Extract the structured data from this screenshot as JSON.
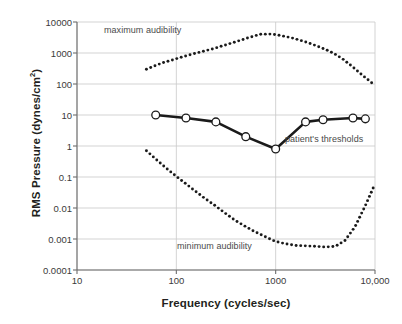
{
  "chart_data": {
    "type": "line",
    "title": "",
    "xlabel": "Frequency (cycles/sec)",
    "ylabel": "RMS Pressure (dynes/cm²)",
    "xscale": "log",
    "yscale": "log",
    "xlim": [
      10,
      10000
    ],
    "ylim": [
      0.0001,
      10000
    ],
    "grid": true,
    "legend_position": "inline-annotations",
    "xticks": [
      {
        "value": 10,
        "label": "10"
      },
      {
        "value": 100,
        "label": "100"
      },
      {
        "value": 1000,
        "label": "1000"
      },
      {
        "value": 10000,
        "label": "10,000"
      }
    ],
    "yticks": [
      {
        "value": 10000,
        "label": "10000"
      },
      {
        "value": 1000,
        "label": "1000"
      },
      {
        "value": 100,
        "label": "100"
      },
      {
        "value": 10,
        "label": "10"
      },
      {
        "value": 1,
        "label": "1"
      },
      {
        "value": 0.1,
        "label": "0.1"
      },
      {
        "value": 0.01,
        "label": "0.01"
      },
      {
        "value": 0.001,
        "label": "0.001"
      },
      {
        "value": 0.0001,
        "label": "0.0001"
      }
    ],
    "series": [
      {
        "name": "maximum audibility",
        "style": "dotted",
        "color": "#1a1a1a",
        "x": [
          50,
          60,
          75,
          95,
          120,
          150,
          190,
          240,
          300,
          380,
          480,
          600,
          700,
          850,
          1000,
          1200,
          1500,
          1900,
          2400,
          3000,
          3800,
          4800,
          6000,
          7500,
          10000
        ],
        "y": [
          300,
          380,
          500,
          620,
          780,
          950,
          1150,
          1400,
          1750,
          2200,
          2800,
          3500,
          4000,
          4100,
          3900,
          3500,
          3000,
          2400,
          1850,
          1400,
          1000,
          620,
          350,
          190,
          90
        ]
      },
      {
        "name": "minimum audibility",
        "style": "dotted",
        "color": "#1a1a1a",
        "x": [
          50,
          62,
          78,
          98,
          125,
          155,
          195,
          245,
          310,
          390,
          490,
          620,
          780,
          980,
          1250,
          1600,
          2000,
          2500,
          3200,
          4000,
          5000,
          6300,
          8000,
          10000
        ],
        "y": [
          0.7,
          0.38,
          0.2,
          0.11,
          0.06,
          0.035,
          0.02,
          0.012,
          0.0068,
          0.004,
          0.0026,
          0.0017,
          0.0012,
          0.00085,
          0.0007,
          0.00062,
          0.0006,
          0.00058,
          0.00055,
          0.00058,
          0.0009,
          0.0025,
          0.012,
          0.06
        ]
      },
      {
        "name": "patient's thresholds",
        "style": "solid-with-markers",
        "color": "#1a1a1a",
        "marker": "open-circle",
        "x": [
          62,
          125,
          250,
          500,
          1000,
          2000,
          3000,
          6000,
          8000
        ],
        "y": [
          10,
          8,
          6,
          2,
          0.8,
          6,
          7,
          8,
          7.5
        ]
      }
    ],
    "annotations": [
      {
        "name": "maximum-audibility-label",
        "text": "maximum audibility"
      },
      {
        "name": "minimum-audibility-label",
        "text": "minimum audibility"
      },
      {
        "name": "patient-thresholds-label",
        "text": "patient's thresholds"
      }
    ]
  }
}
